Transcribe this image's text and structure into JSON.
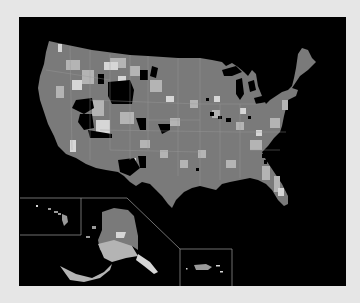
{
  "map": {
    "type": "choropleth",
    "region": "United States (counties)",
    "palette": {
      "frame": "#e6e6e6",
      "background": "#000000",
      "base": "#7a7a7a",
      "light": "#b4b4b4",
      "lighter": "#d6d6d6",
      "dark": "#000000",
      "border": "#9a9a9a",
      "inset_border": "#8c8c8c"
    },
    "insets": [
      "Alaska",
      "Hawaii",
      "Puerto Rico"
    ],
    "legend": null,
    "title": null
  }
}
